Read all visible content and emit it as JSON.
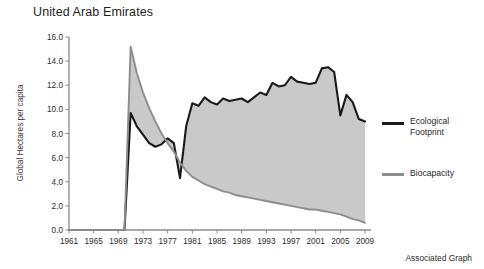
{
  "title": "United Arab Emirates",
  "footer": {
    "caption": "Associated Graph"
  },
  "legend": {
    "position": "right",
    "items": [
      {
        "label": "Ecological\nFootprint",
        "color": "#1a1a1a",
        "name": "ecological-footprint"
      },
      {
        "label": "Biocapacity",
        "color": "#8d8d8d",
        "name": "biocapacity"
      }
    ]
  },
  "axes": {
    "y": {
      "label": "Global Hectares per capita",
      "ticks": [
        "0.0",
        "2.0",
        "4.0",
        "6.0",
        "8.0",
        "10.0",
        "12.0",
        "14.0",
        "16.0"
      ],
      "min": 0,
      "max": 16
    },
    "x": {
      "label": "",
      "ticks": [
        "1961",
        "1965",
        "1969",
        "1973",
        "1977",
        "1981",
        "1985",
        "1989",
        "1993",
        "1997",
        "2001",
        "2005",
        "2009"
      ],
      "min": 1961,
      "max": 2009
    }
  },
  "colors": {
    "footprint_line": "#1a1a1a",
    "biocapacity_line": "#8d8d8d",
    "fill": "#c9c9c9",
    "axis": "#8a8a8a",
    "background": "#ffffff"
  },
  "chart_data": {
    "type": "area",
    "title": "United Arab Emirates",
    "xlabel": "",
    "ylabel": "Global Hectares per capita",
    "xlim": [
      1961,
      2009
    ],
    "ylim": [
      0,
      16
    ],
    "grid": false,
    "legend_position": "right",
    "x": [
      1961,
      1962,
      1963,
      1964,
      1965,
      1966,
      1967,
      1968,
      1969,
      1970,
      1971,
      1972,
      1973,
      1974,
      1975,
      1976,
      1977,
      1978,
      1979,
      1980,
      1981,
      1982,
      1983,
      1984,
      1985,
      1986,
      1987,
      1988,
      1989,
      1990,
      1991,
      1992,
      1993,
      1994,
      1995,
      1996,
      1997,
      1998,
      1999,
      2000,
      2001,
      2002,
      2003,
      2004,
      2005,
      2006,
      2007,
      2008,
      2009
    ],
    "series": [
      {
        "name": "Ecological Footprint",
        "color": "#1a1a1a",
        "values": [
          0.0,
          0.0,
          0.0,
          0.0,
          0.0,
          0.0,
          0.0,
          0.0,
          0.0,
          0.0,
          9.7,
          8.6,
          7.9,
          7.2,
          6.9,
          7.1,
          7.6,
          7.2,
          4.3,
          8.6,
          10.5,
          10.3,
          11.0,
          10.6,
          10.4,
          10.9,
          10.7,
          10.8,
          10.9,
          10.6,
          11.0,
          11.4,
          11.2,
          12.2,
          11.9,
          12.0,
          12.7,
          12.3,
          12.2,
          12.1,
          12.2,
          13.4,
          13.5,
          13.1,
          9.5,
          11.2,
          10.6,
          9.2,
          9.0
        ]
      },
      {
        "name": "Biocapacity",
        "color": "#8d8d8d",
        "values": [
          0.0,
          0.0,
          0.0,
          0.0,
          0.0,
          0.0,
          0.0,
          0.0,
          0.0,
          0.0,
          15.2,
          13.0,
          11.4,
          10.1,
          9.0,
          8.0,
          7.2,
          6.5,
          5.6,
          4.9,
          4.4,
          4.1,
          3.8,
          3.6,
          3.4,
          3.2,
          3.1,
          2.9,
          2.8,
          2.7,
          2.6,
          2.5,
          2.4,
          2.3,
          2.2,
          2.1,
          2.0,
          1.9,
          1.8,
          1.7,
          1.7,
          1.6,
          1.5,
          1.4,
          1.3,
          1.1,
          0.9,
          0.8,
          0.6
        ]
      }
    ]
  }
}
